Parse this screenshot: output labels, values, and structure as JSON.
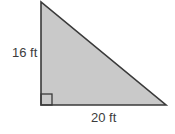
{
  "figure": {
    "type": "right-triangle",
    "colors": {
      "fill": "#c9c9c9",
      "stroke": "#3a3a3a",
      "text": "#3c3c3c",
      "background": "#ffffff"
    },
    "vertices": {
      "top": [
        41,
        2
      ],
      "right_angle": [
        41,
        105
      ],
      "right": [
        166,
        105
      ]
    },
    "right_angle_marker": {
      "x": 41,
      "y": 94,
      "size": 11
    },
    "labels": {
      "vertical_side": "16 ft",
      "horizontal_side": "20 ft"
    }
  }
}
